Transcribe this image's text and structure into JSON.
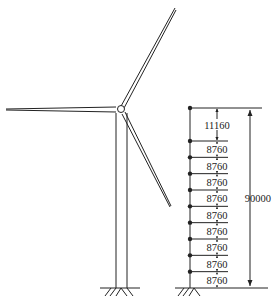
{
  "figure": {
    "segments": [
      {
        "label": "11160"
      },
      {
        "label": "8760"
      },
      {
        "label": "8760"
      },
      {
        "label": "8760"
      },
      {
        "label": "8760"
      },
      {
        "label": "8760"
      },
      {
        "label": "8760"
      },
      {
        "label": "8760"
      },
      {
        "label": "8760"
      },
      {
        "label": "8760"
      }
    ],
    "total_height_label": "90000",
    "colors": {
      "line": "#222222",
      "background": "#ffffff"
    }
  }
}
